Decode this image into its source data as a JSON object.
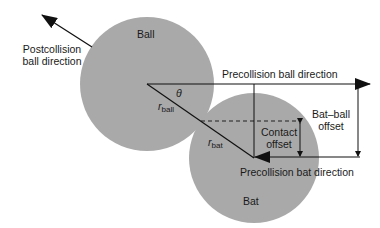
{
  "diagram": {
    "colors": {
      "circle_fill": "#a9a9a9",
      "line": "#111111",
      "background": "#ffffff"
    },
    "labels": {
      "ball": "Ball",
      "bat": "Bat",
      "postcollision_line1": "Postcollision",
      "postcollision_line2": "ball direction",
      "precollision_ball": "Precollision ball direction",
      "precollision_bat": "Precollision bat direction",
      "bat_ball_offset_line1": "Bat–ball",
      "bat_ball_offset_line2": "offset",
      "contact_offset_line1": "Contact",
      "contact_offset_line2": "offset",
      "theta": "θ",
      "r_symbol": "r",
      "r_ball_sub": "ball",
      "r_bat_sub": "bat"
    }
  }
}
